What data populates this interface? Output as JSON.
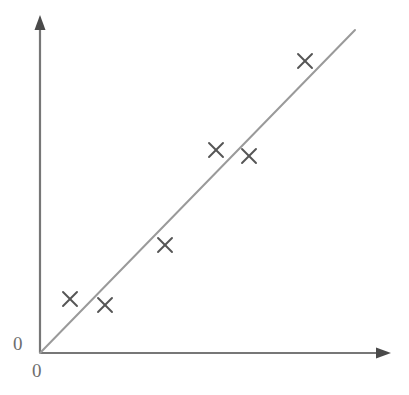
{
  "figure": {
    "width": 409,
    "height": 395,
    "background": "#ffffff"
  },
  "axes": {
    "origin_label_y": "0",
    "origin_label_x": "0",
    "axis_color": "#777777",
    "label_color": "#6e6e6e",
    "origin_px": {
      "x": 40,
      "y": 353
    },
    "y_axis_top_px": 18,
    "x_axis_right_px": 390,
    "arrowheads": [
      "y-axis-arrowhead",
      "x-axis-arrowhead"
    ]
  },
  "chart_data": {
    "type": "scatter",
    "title": "",
    "subtitle": "",
    "xlabel": "",
    "ylabel": "",
    "xlim": [
      0,
      350
    ],
    "ylim": [
      0,
      335
    ],
    "xticks": [
      0
    ],
    "yticks": [
      0
    ],
    "xticklabels": [
      "0"
    ],
    "yticklabels": [
      "0"
    ],
    "grid": false,
    "legend": false,
    "legend_position": "none",
    "marker": "x",
    "marker_color": "#555555",
    "marker_size_px": 14,
    "points": [
      {
        "x": 30,
        "y": 54,
        "px": {
          "x": 70,
          "y": 299
        }
      },
      {
        "x": 65,
        "y": 48,
        "px": {
          "x": 105,
          "y": 305
        }
      },
      {
        "x": 125,
        "y": 108,
        "px": {
          "x": 165,
          "y": 245
        }
      },
      {
        "x": 176,
        "y": 203,
        "px": {
          "x": 216,
          "y": 150
        }
      },
      {
        "x": 209,
        "y": 197,
        "px": {
          "x": 249,
          "y": 156
        }
      },
      {
        "x": 265,
        "y": 292,
        "px": {
          "x": 305,
          "y": 61
        }
      }
    ],
    "series": [
      {
        "name": "observations",
        "type": "scatter",
        "x": [
          30,
          65,
          125,
          176,
          209,
          265
        ],
        "y": [
          54,
          48,
          108,
          203,
          197,
          292
        ]
      },
      {
        "name": "line-of-best-fit",
        "type": "line",
        "color": "#9a9a9a",
        "width_px": 2,
        "x": [
          0,
          315
        ],
        "y": [
          0,
          323
        ],
        "px_start": {
          "x": 40,
          "y": 353
        },
        "px_end": {
          "x": 355,
          "y": 30
        }
      }
    ],
    "annotations": []
  }
}
